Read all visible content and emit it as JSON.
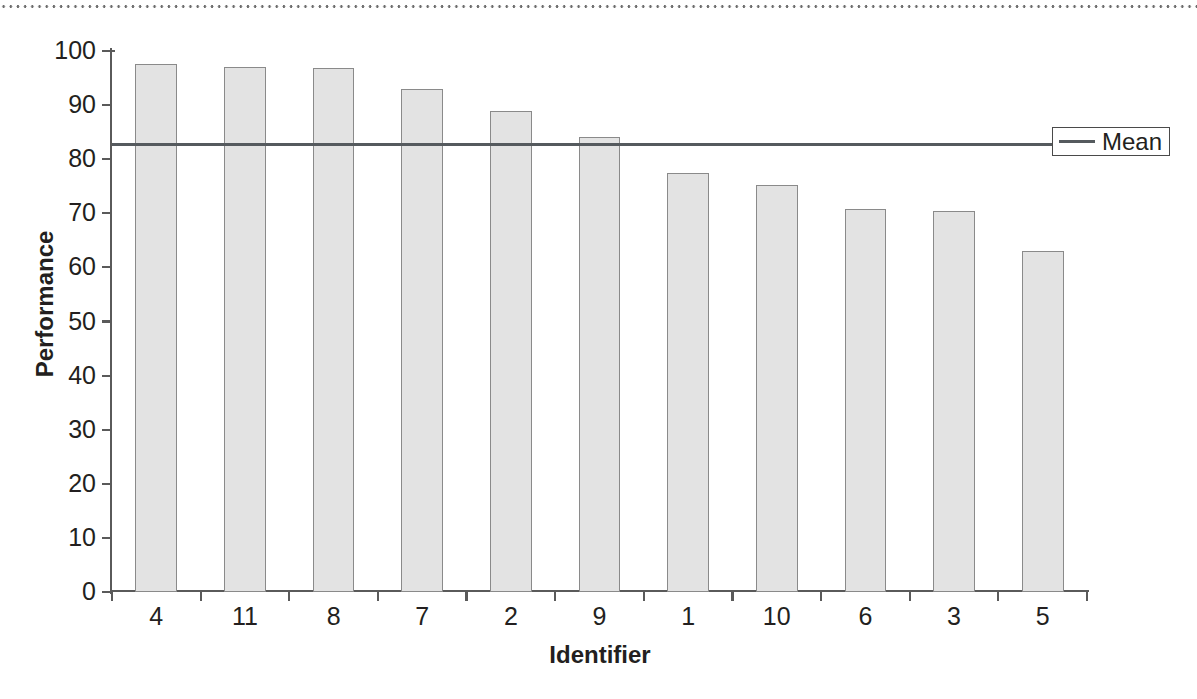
{
  "chart_data": {
    "type": "bar",
    "title": "",
    "xlabel": "Identifier",
    "ylabel": "Performance",
    "categories": [
      "4",
      "11",
      "8",
      "7",
      "2",
      "9",
      "1",
      "10",
      "6",
      "3",
      "5"
    ],
    "values": [
      97.6,
      97.0,
      96.8,
      93.0,
      89.0,
      84.1,
      77.4,
      75.3,
      70.8,
      70.5,
      63.1
    ],
    "ylim": [
      0,
      100
    ],
    "yticks": [
      0,
      10,
      20,
      30,
      40,
      50,
      60,
      70,
      80,
      90,
      100
    ],
    "ytick_labels": [
      "0",
      "10",
      "20",
      "30",
      "40",
      "50",
      "60",
      "70",
      "80",
      "90",
      "100"
    ],
    "grid": false,
    "legend_position": "right",
    "series": [
      {
        "name": "Performance",
        "kind": "bar",
        "values": [
          97.6,
          97.0,
          96.8,
          93.0,
          89.0,
          84.1,
          77.4,
          75.3,
          70.8,
          70.5,
          63.1
        ],
        "fill_color": "#e3e3e3",
        "edge_color": "#8a8a8a"
      },
      {
        "name": "Mean",
        "kind": "hline",
        "value": 82.8,
        "color": "#555a5e"
      }
    ],
    "annotations": []
  },
  "legend": {
    "entries": [
      {
        "label": "Mean",
        "marker": "line",
        "color": "#555a5e"
      }
    ]
  },
  "decoration": {
    "top_rule": "dotted"
  },
  "colors": {
    "bar_fill": "#e3e3e3",
    "bar_edge": "#8a8a8a",
    "axis": "#5a5a5a",
    "mean_line": "#555a5e",
    "text": "#231f20",
    "background": "#ffffff"
  }
}
